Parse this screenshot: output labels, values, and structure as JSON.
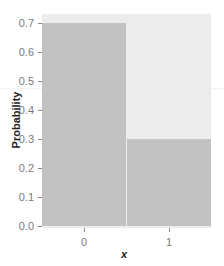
{
  "chart_data": {
    "type": "bar",
    "title": "",
    "xlabel": "x",
    "ylabel": "Probability",
    "categories": [
      "0",
      "1"
    ],
    "values": [
      0.7,
      0.3
    ],
    "ylim": [
      0,
      0.72
    ],
    "yticks": [
      "0.0",
      "0.1",
      "0.2",
      "0.3",
      "0.4",
      "0.5",
      "0.6",
      "0.7"
    ],
    "grid": false,
    "legend": null,
    "colors": {
      "bar": "#c2c2c2",
      "panel": "#ececec"
    }
  }
}
